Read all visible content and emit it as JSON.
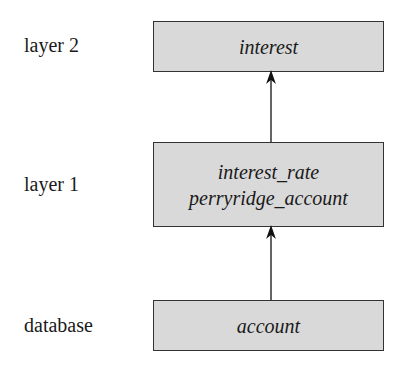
{
  "layers": [
    {
      "label": "layer 2",
      "lines": [
        "interest"
      ]
    },
    {
      "label": "layer 1",
      "lines": [
        "interest_rate",
        "perryridge_account"
      ]
    },
    {
      "label": "database",
      "lines": [
        "account"
      ]
    }
  ],
  "colors": {
    "box_fill": "#d9d9d9",
    "border": "#333333"
  }
}
